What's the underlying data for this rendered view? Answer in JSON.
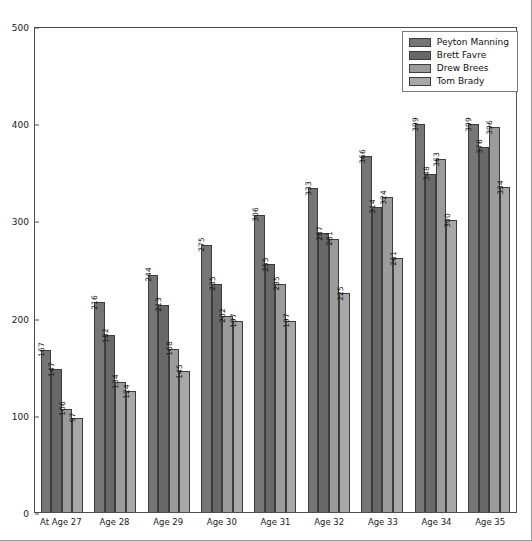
{
  "chart_data": {
    "type": "bar",
    "title": "",
    "xlabel": "",
    "ylabel": "",
    "ylim": [
      0,
      500
    ],
    "yticks": [
      0,
      100,
      200,
      300,
      400,
      500
    ],
    "grid": false,
    "legend_position": "upper right",
    "categories": [
      "At Age 27",
      "Age 28",
      "Age 29",
      "Age 30",
      "Age 31",
      "Age 32",
      "Age 33",
      "Age 34",
      "Age 35"
    ],
    "series": [
      {
        "name": "Peyton Manning",
        "color": "#767676",
        "values": [
          167,
          216,
          244,
          275,
          306,
          333,
          366,
          399,
          399
        ]
      },
      {
        "name": "Brett Favre",
        "color": "#686868",
        "values": [
          147,
          182,
          213,
          235,
          255,
          287,
          314,
          348,
          376
        ]
      },
      {
        "name": "Drew Brees",
        "color": "#9b9b9b",
        "values": [
          106,
          134,
          168,
          202,
          235,
          281,
          324,
          363,
          396
        ]
      },
      {
        "name": "Tom Brady",
        "color": "#a8a8a8",
        "values": [
          97,
          124,
          145,
          197,
          197,
          225,
          261,
          300,
          334
        ]
      }
    ]
  },
  "legend": {
    "entries": [
      {
        "label": "Peyton Manning"
      },
      {
        "label": "Brett Favre"
      },
      {
        "label": "Drew Brees"
      },
      {
        "label": "Tom Brady"
      }
    ]
  }
}
